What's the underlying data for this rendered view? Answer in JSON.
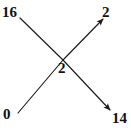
{
  "diagram": {
    "type": "crossing-node-diagram",
    "width": 131,
    "height": 131,
    "background_color": "#ffffff",
    "stroke_color": "#1a1a1a",
    "label_color": "#111111",
    "center_node": {
      "name": "center-node",
      "label": "2",
      "x": 63,
      "y": 60
    },
    "labels": {
      "top_left": "16",
      "top_right": "2",
      "center": "2",
      "bottom_left": "0",
      "bottom_right": "14"
    },
    "edges": [
      {
        "name": "edge-top-left-to-center",
        "from_label": "16",
        "to_label": "2",
        "x1": 20,
        "y1": 18,
        "x2": 63,
        "y2": 60,
        "arrow": false,
        "direction": "down-right"
      },
      {
        "name": "edge-bottom-left-to-center",
        "from_label": "0",
        "to_label": "2",
        "x1": 18,
        "y1": 113,
        "x2": 63,
        "y2": 60,
        "arrow": false,
        "direction": "up-right"
      },
      {
        "name": "edge-center-to-top-right",
        "from_label": "2",
        "to_label": "2",
        "x1": 63,
        "y1": 60,
        "x2": 104,
        "y2": 18,
        "arrow": true,
        "direction": "up-right"
      },
      {
        "name": "edge-center-to-bottom-right",
        "from_label": "2",
        "to_label": "14",
        "x1": 63,
        "y1": 60,
        "x2": 112,
        "y2": 112,
        "arrow": true,
        "direction": "down-right"
      }
    ]
  }
}
